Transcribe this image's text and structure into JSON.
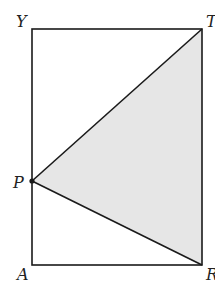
{
  "diagram": {
    "type": "geometry",
    "colors": {
      "stroke": "#1a1a1a",
      "shade": "#e6e6e6",
      "background": "#ffffff"
    },
    "points": {
      "Y": {
        "label": "Y",
        "x": 32,
        "y": 29
      },
      "T": {
        "label": "T",
        "x": 202,
        "y": 29
      },
      "R": {
        "label": "R",
        "x": 202,
        "y": 265
      },
      "A": {
        "label": "A",
        "x": 32,
        "y": 265
      },
      "P": {
        "label": "P",
        "x": 32,
        "y": 181
      }
    },
    "shaded_region": [
      "P",
      "T",
      "R"
    ],
    "segments": [
      [
        "Y",
        "T"
      ],
      [
        "T",
        "R"
      ],
      [
        "R",
        "A"
      ],
      [
        "A",
        "Y"
      ],
      [
        "P",
        "T"
      ],
      [
        "P",
        "R"
      ]
    ]
  }
}
